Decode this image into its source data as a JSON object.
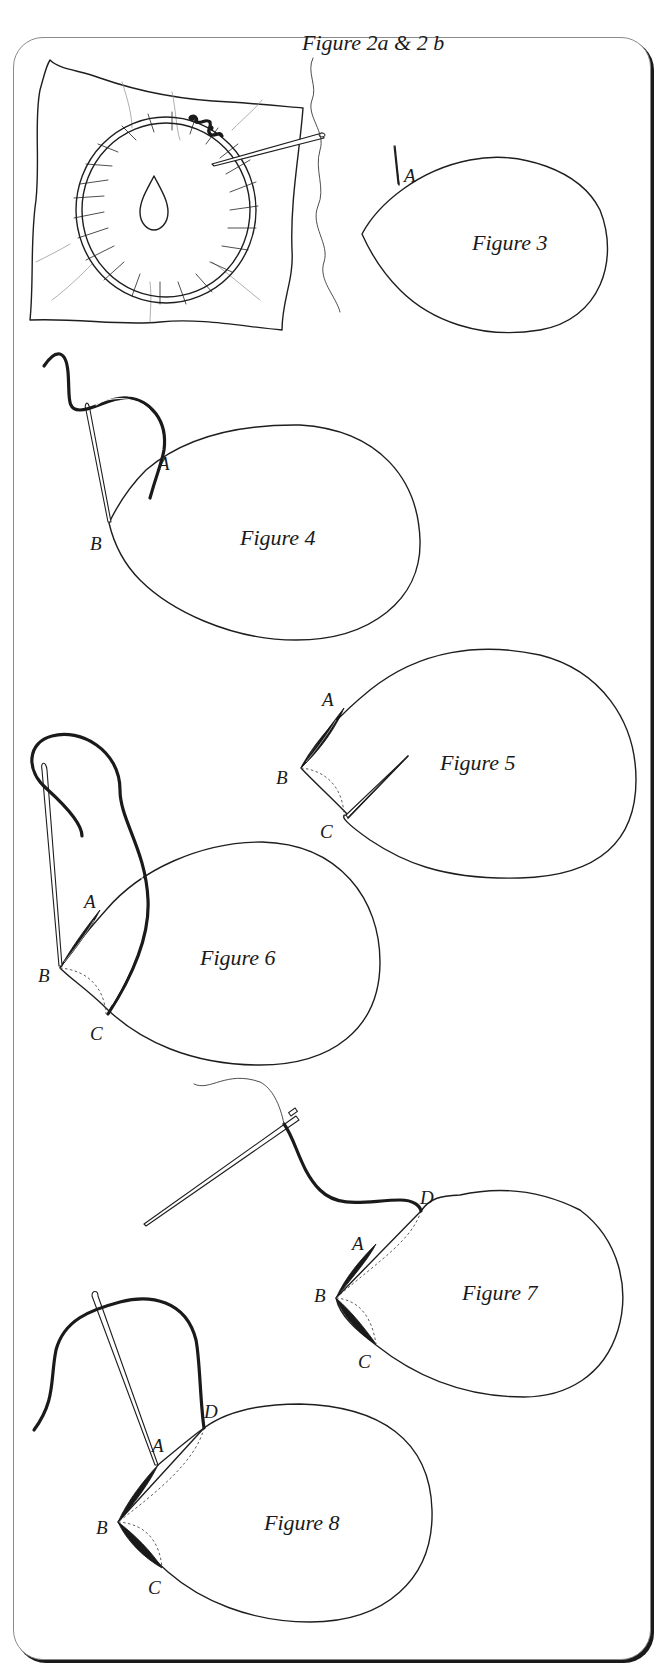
{
  "figures": [
    {
      "id": "fig2",
      "title": "Figure 2a & 2 b",
      "depicts": "Fabric mounted in an embroidery hoop with a needle and thread; small teardrop petal outline in the centre",
      "points": []
    },
    {
      "id": "fig3",
      "title": "Figure  3",
      "depicts": "Petal outline with needle coming up at point A",
      "points": [
        "A"
      ]
    },
    {
      "id": "fig4",
      "title": "Figure 4",
      "depicts": "Thread brought up at A, needle going down at tip B",
      "points": [
        "A",
        "B"
      ]
    },
    {
      "id": "fig5",
      "title": "Figure 5",
      "depicts": "Stitch completed from A to B; needle coming up at C, dotted guide from B to C",
      "points": [
        "A",
        "B",
        "C"
      ]
    },
    {
      "id": "fig6",
      "title": "Figure 6",
      "depicts": "Thread from C taken down at B",
      "points": [
        "A",
        "B",
        "C"
      ]
    },
    {
      "id": "fig7",
      "title": "Figure 7",
      "depicts": "Stitches A–B and B–C completed; needle comes up at D",
      "points": [
        "D",
        "A",
        "B",
        "C"
      ]
    },
    {
      "id": "fig8",
      "title": "Figure 8",
      "depicts": "Thread from D taken down near B, continuing the fill",
      "points": [
        "D",
        "A",
        "B",
        "C"
      ]
    }
  ],
  "labels": {
    "A": "A",
    "B": "B",
    "C": "C",
    "D": "D"
  }
}
